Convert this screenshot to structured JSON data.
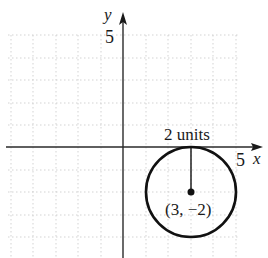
{
  "diagram": {
    "type": "coordinate-plane-circle",
    "axes": {
      "x_label": "x",
      "y_label": "y",
      "x_tick_label": "5",
      "y_tick_label": "5",
      "x_tick_value": 5,
      "y_tick_value": 5
    },
    "grid": {
      "x_range": [
        -5,
        5
      ],
      "y_range": [
        -4,
        5
      ],
      "step": 1,
      "style": "dotted"
    },
    "circle": {
      "center": [
        3,
        -2
      ],
      "radius": 2,
      "center_label": "(3, −2)",
      "radius_label": "2 units"
    },
    "colors": {
      "axis": "#2a2a2a",
      "grid": "#c8c8c8",
      "circle": "#111111"
    }
  }
}
